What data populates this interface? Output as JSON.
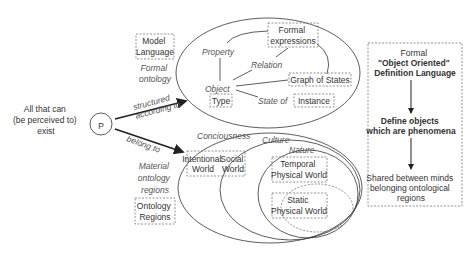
{
  "left": {
    "source_label": [
      "All that can",
      "(be perceived to)",
      "exist"
    ],
    "p_symbol": "P",
    "arrow_top_label": [
      "structured",
      "according to"
    ],
    "arrow_bottom_label": "belong to"
  },
  "formal": {
    "model_language": [
      "Model",
      "Language"
    ],
    "formal_ontology": [
      "Formal",
      "ontology"
    ],
    "formal_expressions": [
      "Formal",
      "expressions"
    ],
    "property": "Property",
    "relation": "Relation",
    "object": "Object",
    "type": "Type",
    "graph_of_states": "Graph of States",
    "state_of": "State of",
    "instance": "Instance"
  },
  "material": {
    "material_ontology": [
      "Material",
      "ontology",
      "regions"
    ],
    "ontology_regions": [
      "Ontology",
      "Regions"
    ],
    "conciousness": "Conciousness",
    "culture": "Culture",
    "nature": "Nature",
    "intentional_world": [
      "Intentional",
      "World"
    ],
    "social_world": [
      "Social",
      "World"
    ],
    "temporal_physical_world": [
      "Temporal",
      "Physical World"
    ],
    "static_physical_world": [
      "Static",
      "Physical World"
    ]
  },
  "right_panel": {
    "title": [
      "Formal",
      "\"Object Oriented\"",
      "Definition Language"
    ],
    "step2": [
      "Define objects",
      "which are phenomena"
    ],
    "step3": [
      "Shared between minds",
      "belonging ontological",
      "regions"
    ]
  }
}
